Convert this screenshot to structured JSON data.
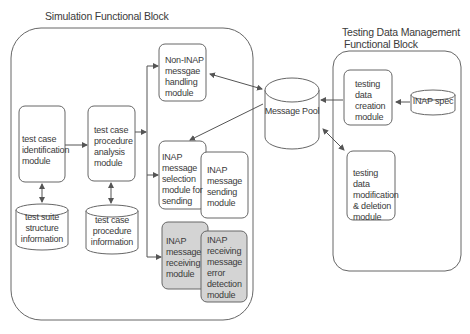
{
  "blocks": {
    "simulation": {
      "title": "Simulation Functional Block"
    },
    "testing_data": {
      "title_line1": "Testing Data Management",
      "title_line2": "Functional Block"
    }
  },
  "modules": {
    "test_case_identification": "test case identification module",
    "test_case_procedure_analysis": "test case procedure analysis module",
    "non_inap_handling": "Non-INAP messgae handling module",
    "inap_selection": "INAP message selection module for sending",
    "inap_sending": "INAP message sending module",
    "inap_receiving": "INAP message receiving module",
    "inap_error_detection": "INAP receiving message error detection module",
    "testing_data_creation": "testing data creation module",
    "testing_data_modification": "testing data modification & deletion module"
  },
  "stores": {
    "test_suite_structure": "test suite structure information",
    "test_case_procedure": "test case procedure information",
    "message_pool": "Message Pool",
    "inap_spec": "INAP spec"
  },
  "colors": {
    "stroke": "#555555",
    "shaded_fill": "#d4d4d4",
    "background": "#ffffff"
  }
}
